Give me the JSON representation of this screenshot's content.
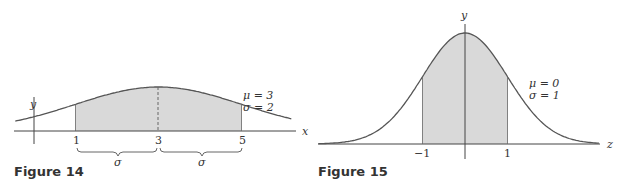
{
  "figures": [
    {
      "caption": "Figure 14",
      "params": {
        "mu_label": "μ = 3",
        "sigma_label": "σ = 2"
      },
      "x_axis_label": "x",
      "y_axis_label": "y",
      "ticks": [
        "1",
        "3",
        "5"
      ],
      "brace_labels": [
        "σ",
        "σ"
      ]
    },
    {
      "caption": "Figure 15",
      "params": {
        "mu_label": "μ = 0",
        "sigma_label": "σ = 1"
      },
      "x_axis_label": "z",
      "y_axis_label": "y",
      "ticks": [
        "−1",
        "1"
      ]
    }
  ],
  "colors": {
    "curve": "#555555",
    "fill": "#d9d9d9",
    "axis": "#444444"
  },
  "chart_data": [
    {
      "type": "area",
      "title": "Figure 14",
      "xlabel": "x",
      "ylabel": "y",
      "distribution": "normal",
      "mu": 3,
      "sigma": 2,
      "shaded_interval": [
        1,
        5
      ],
      "tick_labels": [
        "1",
        "3",
        "5"
      ],
      "annotations": [
        "μ = 3",
        "σ = 2",
        "σ (brace from 1 to 3)",
        "σ (brace from 3 to 5)",
        "dashed line at x = 3"
      ],
      "grid": false
    },
    {
      "type": "area",
      "title": "Figure 15",
      "xlabel": "z",
      "ylabel": "y",
      "distribution": "normal",
      "mu": 0,
      "sigma": 1,
      "shaded_interval": [
        -1,
        1
      ],
      "tick_labels": [
        "−1",
        "1"
      ],
      "annotations": [
        "μ = 0",
        "σ = 1"
      ],
      "grid": false
    }
  ]
}
